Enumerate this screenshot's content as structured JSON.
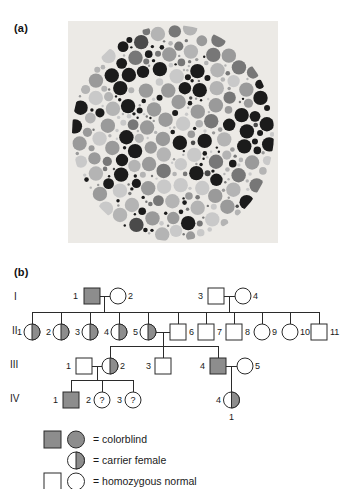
{
  "figure": {
    "panel_a_label": "(a)",
    "panel_b_label": "(b)"
  },
  "plate": {
    "name": "ishihara-colorblindness-test-plate",
    "description": "grayscale Ishihara pseudoisochromatic dot plate",
    "background_color": "#ecebe7",
    "dot_colors": [
      "#1b1b1b",
      "#4a4a4a",
      "#777777",
      "#9a9a9a",
      "#b4b4b4",
      "#c9c9c9"
    ]
  },
  "pedigree": {
    "generation_labels": [
      "I",
      "II",
      "III",
      "IV"
    ],
    "colors": {
      "affected_fill": "#8d8d8d",
      "normal_fill": "#ffffff",
      "stroke": "#2b2b2b"
    },
    "generations": [
      {
        "roman": "I",
        "individuals": [
          {
            "id": "1",
            "sex": "male",
            "status": "colorblind",
            "label_side": "left"
          },
          {
            "id": "2",
            "sex": "female",
            "status": "homozygous-normal",
            "label_side": "right"
          },
          {
            "id": "3",
            "sex": "male",
            "status": "homozygous-normal",
            "label_side": "left"
          },
          {
            "id": "4",
            "sex": "female",
            "status": "homozygous-normal",
            "label_side": "right"
          }
        ]
      },
      {
        "roman": "II",
        "individuals": [
          {
            "id": "1",
            "sex": "female",
            "status": "carrier",
            "label_side": "left"
          },
          {
            "id": "2",
            "sex": "female",
            "status": "carrier",
            "label_side": "left"
          },
          {
            "id": "3",
            "sex": "female",
            "status": "carrier",
            "label_side": "left"
          },
          {
            "id": "4",
            "sex": "female",
            "status": "carrier",
            "label_side": "left"
          },
          {
            "id": "5",
            "sex": "female",
            "status": "carrier",
            "label_side": "left"
          },
          {
            "id": "6",
            "sex": "male",
            "status": "homozygous-normal",
            "label_side": "right"
          },
          {
            "id": "7",
            "sex": "male",
            "status": "homozygous-normal",
            "label_side": "right"
          },
          {
            "id": "8",
            "sex": "male",
            "status": "homozygous-normal",
            "label_side": "right"
          },
          {
            "id": "9",
            "sex": "female",
            "status": "homozygous-normal",
            "label_side": "right"
          },
          {
            "id": "10",
            "sex": "female",
            "status": "homozygous-normal",
            "label_side": "right"
          },
          {
            "id": "11",
            "sex": "male",
            "status": "homozygous-normal",
            "label_side": "right"
          }
        ]
      },
      {
        "roman": "III",
        "individuals": [
          {
            "id": "1",
            "sex": "male",
            "status": "homozygous-normal",
            "label_side": "left"
          },
          {
            "id": "2",
            "sex": "female",
            "status": "carrier",
            "label_side": "right"
          },
          {
            "id": "3",
            "sex": "male",
            "status": "homozygous-normal",
            "label_side": "left"
          },
          {
            "id": "4",
            "sex": "male",
            "status": "colorblind",
            "label_side": "left"
          },
          {
            "id": "5",
            "sex": "female",
            "status": "homozygous-normal",
            "label_side": "right"
          }
        ]
      },
      {
        "roman": "IV",
        "individuals": [
          {
            "id": "1",
            "sex": "male",
            "status": "colorblind",
            "label_side": "left"
          },
          {
            "id": "2",
            "sex": "female",
            "status": "unknown",
            "label_side": "left",
            "inner_text": "?"
          },
          {
            "id": "3",
            "sex": "female",
            "status": "unknown",
            "label_side": "left",
            "inner_text": "?"
          },
          {
            "id": "4",
            "sex": "female",
            "status": "carrier",
            "label_side": "left",
            "below_text": "1"
          }
        ]
      }
    ]
  },
  "legend": {
    "entries": [
      {
        "key": "colorblind",
        "text": "= colorblind",
        "symbols": [
          "filled-square",
          "filled-circle"
        ]
      },
      {
        "key": "carrier-female",
        "text": "= carrier female",
        "symbols": [
          "half-filled-circle"
        ]
      },
      {
        "key": "homozygous-normal",
        "text": "= homozygous normal",
        "symbols": [
          "open-square",
          "open-circle"
        ]
      }
    ]
  }
}
